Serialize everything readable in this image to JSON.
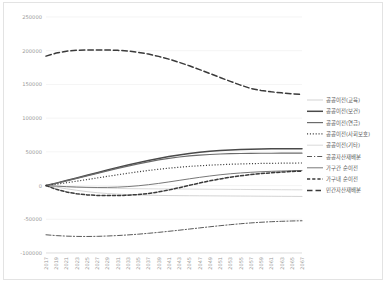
{
  "chart_data": {
    "type": "line",
    "title": "",
    "subtitle": "",
    "xlabel": "",
    "ylabel": "",
    "ylim": [
      -100000,
      250000
    ],
    "yticks": [
      -100000,
      -50000,
      0,
      50000,
      100000,
      150000,
      200000,
      250000
    ],
    "ytick_labels": [
      "-100000",
      "-50000",
      "0",
      "50000",
      "100000",
      "150000",
      "200000",
      "250000"
    ],
    "grid": true,
    "legend_position": "right",
    "x": [
      2017,
      2019,
      2021,
      2023,
      2025,
      2027,
      2029,
      2031,
      2033,
      2035,
      2037,
      2039,
      2041,
      2043,
      2045,
      2047,
      2049,
      2051,
      2053,
      2055,
      2057,
      2059,
      2061,
      2063,
      2065,
      2067
    ],
    "xtick_labels": [
      "2017",
      "2019",
      "2021",
      "2023",
      "2025",
      "2027",
      "2029",
      "2031",
      "2033",
      "2035",
      "2037",
      "2039",
      "2041",
      "2043",
      "2045",
      "2047",
      "2049",
      "2051",
      "2053",
      "2055",
      "2057",
      "2059",
      "2061",
      "2063",
      "2065",
      "2067"
    ],
    "series": [
      {
        "name": "공공이전(교육)",
        "style": "solid",
        "color": "#c8c8c8",
        "width": 0.8,
        "values": [
          0,
          -2200,
          -4800,
          -7000,
          -9000,
          -10600,
          -11800,
          -12700,
          -13400,
          -13900,
          -14300,
          -14600,
          -14800,
          -14950,
          -15050,
          -15150,
          -15250,
          -15350,
          -15450,
          -15550,
          -15650,
          -15750,
          -15850,
          -15950,
          -16050,
          -16150
        ]
      },
      {
        "name": "공공이전(보건)",
        "style": "solid",
        "color": "#4a4a4a",
        "width": 1.5,
        "values": [
          0,
          3600,
          7400,
          11300,
          15200,
          19100,
          23000,
          26800,
          30500,
          34000,
          37300,
          40300,
          43000,
          45400,
          47500,
          49300,
          50800,
          52000,
          52900,
          53600,
          54000,
          54300,
          54500,
          54600,
          54650,
          54700
        ]
      },
      {
        "name": "공공이전(연금)",
        "style": "solid",
        "color": "#6b6b6b",
        "width": 1.2,
        "values": [
          0,
          3400,
          7000,
          10700,
          14400,
          18100,
          21800,
          25400,
          28900,
          32200,
          35200,
          38000,
          40400,
          42400,
          44000,
          45200,
          46100,
          46800,
          47300,
          47600,
          47800,
          47900,
          47950,
          48000,
          48000,
          48000
        ]
      },
      {
        "name": "공공이전(사회보호)",
        "style": "dotted",
        "color": "#3c3c3c",
        "width": 1.2,
        "values": [
          0,
          2000,
          4200,
          6500,
          8900,
          11300,
          13700,
          16000,
          18300,
          20400,
          22400,
          24200,
          25800,
          27200,
          28400,
          29400,
          30300,
          31000,
          31600,
          32100,
          32500,
          32800,
          33000,
          33200,
          33350,
          33500
        ]
      },
      {
        "name": "공공이전(기타)",
        "style": "solid",
        "color": "#cfcfcf",
        "width": 0.8,
        "values": [
          0,
          -900,
          -1700,
          -2400,
          -3000,
          -3500,
          -3900,
          -4200,
          -4500,
          -4700,
          -4850,
          -4950,
          -5050,
          -5150,
          -5250,
          -5350,
          -5450,
          -5550,
          -5650,
          -5750,
          -5850,
          -5950,
          -6050,
          -6150,
          -6250,
          -6350
        ]
      },
      {
        "name": "공공자산재배분",
        "style": "dashdot",
        "color": "#5a5a5a",
        "width": 1.0,
        "values": [
          -73000,
          -74200,
          -75000,
          -75400,
          -75500,
          -75300,
          -74800,
          -74100,
          -73200,
          -72100,
          -70800,
          -69400,
          -67800,
          -66200,
          -64500,
          -62800,
          -61100,
          -59500,
          -58000,
          -56600,
          -55400,
          -54400,
          -53600,
          -53000,
          -52500,
          -52200
        ]
      },
      {
        "name": "가구간 순이전",
        "style": "solid",
        "color": "#787878",
        "width": 1.0,
        "values": [
          0,
          -800,
          -1600,
          -2200,
          -2600,
          -2800,
          -2700,
          -2300,
          -1500,
          -300,
          1300,
          3200,
          5400,
          7700,
          10000,
          12200,
          14200,
          16000,
          17500,
          18700,
          19700,
          20500,
          21100,
          21600,
          22000,
          22400
        ]
      },
      {
        "name": "가구내 순이전",
        "style": "dashed-short",
        "color": "#3a3a3a",
        "width": 1.5,
        "values": [
          0,
          -5500,
          -9500,
          -12200,
          -13800,
          -14600,
          -14900,
          -14800,
          -14300,
          -13300,
          -11700,
          -9400,
          -6500,
          -3200,
          300,
          3800,
          7000,
          9900,
          12400,
          14500,
          16300,
          17800,
          19000,
          20000,
          20800,
          21500
        ]
      },
      {
        "name": "민간자산재배분",
        "style": "dashed-long",
        "color": "#3a3a3a",
        "width": 1.5,
        "values": [
          192000,
          196500,
          199300,
          200600,
          201000,
          201100,
          201000,
          200600,
          199500,
          197600,
          195000,
          191600,
          187500,
          182800,
          177600,
          172000,
          166200,
          160300,
          154500,
          149000,
          144000,
          141000,
          139000,
          137500,
          136200,
          135000
        ]
      }
    ]
  },
  "legend": {
    "entries": [
      {
        "label": "공공이전(교육)"
      },
      {
        "label": "공공이전(보건)"
      },
      {
        "label": "공공이전(연금)"
      },
      {
        "label": "공공이전(사회보호)"
      },
      {
        "label": "공공이전(기타)"
      },
      {
        "label": "공공자산재배분"
      },
      {
        "label": "가구간 순이전"
      },
      {
        "label": "가구내 순이전"
      },
      {
        "label": "민간자산재배분"
      }
    ]
  }
}
